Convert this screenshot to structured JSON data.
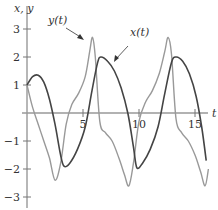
{
  "chart_data": {
    "type": "line",
    "title": "",
    "xlabel": "t",
    "ylabel": "x, y",
    "xlim": [
      0,
      16.3
    ],
    "ylim": [
      -3.4,
      3.8
    ],
    "grid": false,
    "x_ticks": [
      5,
      10,
      15
    ],
    "x_tick_labels": [
      "5",
      "10",
      "15"
    ],
    "y_ticks": [
      3,
      2,
      1,
      -1,
      -2,
      -3
    ],
    "y_tick_labels": [
      "3",
      "2",
      "1",
      "−1",
      "−2",
      "−3"
    ],
    "legend": "inline annotations with arrows",
    "series": [
      {
        "name": "x(t)",
        "color": "#444444",
        "t": [
          0,
          0.5,
          1.0,
          1.5,
          2.0,
          2.5,
          3.0,
          3.3,
          3.8,
          4.5,
          5.2,
          5.8,
          6.3,
          6.6,
          7.2,
          7.8,
          8.4,
          9.0,
          9.5,
          9.8,
          10.3,
          11.0,
          11.7,
          12.3,
          12.9,
          13.3,
          13.9,
          14.5,
          15.1,
          15.6,
          16.0
        ],
        "values": [
          1.0,
          1.3,
          1.35,
          1.1,
          0.5,
          -0.4,
          -1.5,
          -1.9,
          -1.8,
          -1.3,
          -0.5,
          0.8,
          1.8,
          2.0,
          1.85,
          1.5,
          0.9,
          0.0,
          -1.2,
          -1.95,
          -1.8,
          -1.3,
          -0.5,
          0.7,
          1.8,
          2.0,
          1.85,
          1.4,
          0.6,
          -0.5,
          -1.7
        ]
      },
      {
        "name": "y(t)",
        "color": "#999999",
        "t": [
          0,
          0.5,
          1.0,
          1.5,
          2.0,
          2.5,
          3.0,
          3.5,
          4.0,
          4.6,
          5.2,
          5.6,
          5.85,
          6.1,
          6.5,
          7.0,
          7.6,
          8.2,
          8.7,
          9.1,
          9.5,
          10.0,
          10.6,
          11.2,
          11.8,
          12.3,
          12.6,
          12.9,
          13.3,
          13.8,
          14.4,
          15.0,
          15.5,
          15.9,
          16.2
        ],
        "values": [
          1.0,
          0.2,
          -0.4,
          -1.0,
          -1.6,
          -2.4,
          -1.8,
          -0.4,
          0.3,
          0.7,
          1.3,
          2.2,
          2.7,
          2.0,
          -0.3,
          -0.7,
          -1.0,
          -1.6,
          -2.2,
          -2.6,
          -1.8,
          -0.3,
          0.4,
          0.8,
          1.4,
          2.2,
          2.7,
          2.1,
          -0.2,
          -0.7,
          -1.0,
          -1.5,
          -2.1,
          -2.6,
          -2.0
        ]
      }
    ],
    "annotations": [
      {
        "text": "y(t)",
        "arrow_to": "y(t) peak near t≈5.5"
      },
      {
        "text": "x(t)",
        "arrow_to": "x(t) near t≈7.8"
      }
    ]
  },
  "labels": {
    "y_axis": "x, y",
    "x_axis": "t",
    "y_curve": "y(t)",
    "x_curve": "x(t)"
  }
}
